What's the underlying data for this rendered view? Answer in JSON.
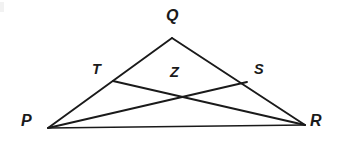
{
  "figure": {
    "name": "triangle-with-cevians",
    "background_color": "#ffffff",
    "stroke_color": "#1a1a1a",
    "width": 339,
    "height": 150
  },
  "labels": {
    "Q": "Q",
    "T": "T",
    "Z": "Z",
    "S": "S",
    "P": "P",
    "R": "R"
  },
  "label_positions": {
    "Q": {
      "x": 166,
      "y": 8
    },
    "T": {
      "x": 92,
      "y": 62
    },
    "Z": {
      "x": 170,
      "y": 65
    },
    "S": {
      "x": 254,
      "y": 62
    },
    "P": {
      "x": 21,
      "y": 113
    },
    "R": {
      "x": 310,
      "y": 113
    }
  },
  "points": {
    "P": {
      "x": 48,
      "y": 128
    },
    "Q": {
      "x": 172,
      "y": 38
    },
    "R": {
      "x": 305,
      "y": 125
    },
    "T": {
      "x": 113,
      "y": 81
    },
    "S": {
      "x": 247,
      "y": 82
    },
    "Z": {
      "x": 176,
      "y": 96
    }
  },
  "segments": [
    {
      "name": "segment-PQ",
      "from": "P",
      "to": "Q",
      "path": "M 48 128 L 172 38"
    },
    {
      "name": "segment-QR",
      "from": "Q",
      "to": "R",
      "path": "M 172 38 L 305 125"
    },
    {
      "name": "segment-PR",
      "from": "P",
      "to": "R",
      "path": "M 48 128 L 305 125"
    },
    {
      "name": "cevian-PS",
      "from": "P",
      "to": "S",
      "path": "M 48 128 L 247 82"
    },
    {
      "name": "cevian-TR",
      "from": "T",
      "to": "R",
      "path": "M 113 81 L 305 125"
    }
  ]
}
